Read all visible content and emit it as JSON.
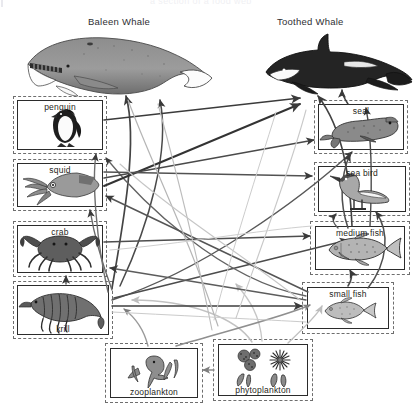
{
  "header": {
    "cropped_text": "a section of a food web",
    "visible": false
  },
  "diagram": {
    "producers": [
      "phytoplankton"
    ],
    "apex": [
      "Baleen Whale",
      "Toothed Whale"
    ]
  },
  "whales": [
    {
      "id": "baleen-whale",
      "label": "Baleen Whale",
      "x": 88,
      "y": 16
    },
    {
      "id": "toothed-whale",
      "label": "Toothed Whale",
      "x": 277,
      "y": 16
    }
  ],
  "nodes": [
    {
      "id": "penguin",
      "label": "penguin",
      "caption": "top",
      "x": 17,
      "y": 100,
      "w": 86,
      "h": 50,
      "dashed": true
    },
    {
      "id": "squid",
      "label": "squid",
      "caption": "top",
      "x": 17,
      "y": 163,
      "w": 86,
      "h": 44,
      "dashed": true
    },
    {
      "id": "crab",
      "label": "crab",
      "caption": "top",
      "x": 17,
      "y": 225,
      "w": 86,
      "h": 48,
      "dashed": true
    },
    {
      "id": "krill",
      "label": "krill",
      "caption": "bottom",
      "x": 17,
      "y": 285,
      "w": 92,
      "h": 50,
      "dashed": true
    },
    {
      "id": "seal",
      "label": "seal",
      "caption": "top",
      "x": 318,
      "y": 104,
      "w": 86,
      "h": 46,
      "dashed": true
    },
    {
      "id": "sea-bird",
      "label": "sea bird",
      "caption": "top",
      "x": 318,
      "y": 166,
      "w": 88,
      "h": 46,
      "dashed": true
    },
    {
      "id": "medium-fish",
      "label": "medium fish",
      "caption": "top",
      "x": 315,
      "y": 226,
      "w": 90,
      "h": 44,
      "dashed": true
    },
    {
      "id": "small-fish",
      "label": "small fish",
      "caption": "top",
      "x": 307,
      "y": 287,
      "w": 82,
      "h": 42,
      "dashed": true
    },
    {
      "id": "zooplankton",
      "label": "zooplankton",
      "caption": "bottom",
      "x": 110,
      "y": 348,
      "w": 88,
      "h": 50,
      "dashed": true
    },
    {
      "id": "phytoplankton",
      "label": "phytoplankton",
      "caption": "bottom",
      "x": 218,
      "y": 344,
      "w": 90,
      "h": 52,
      "dashed": true
    }
  ],
  "links": [
    {
      "from": "phytoplankton",
      "to": "zooplankton"
    },
    {
      "from": "phytoplankton",
      "to": "krill"
    },
    {
      "from": "phytoplankton",
      "to": "small-fish"
    },
    {
      "from": "zooplankton",
      "to": "krill"
    },
    {
      "from": "zooplankton",
      "to": "small-fish"
    },
    {
      "from": "krill",
      "to": "baleen-whale"
    },
    {
      "from": "krill",
      "to": "crab"
    },
    {
      "from": "krill",
      "to": "squid"
    },
    {
      "from": "krill",
      "to": "penguin"
    },
    {
      "from": "krill",
      "to": "small-fish"
    },
    {
      "from": "krill",
      "to": "seal"
    },
    {
      "from": "small-fish",
      "to": "medium-fish"
    },
    {
      "from": "small-fish",
      "to": "sea-bird"
    },
    {
      "from": "small-fish",
      "to": "penguin"
    },
    {
      "from": "small-fish",
      "to": "squid"
    },
    {
      "from": "medium-fish",
      "to": "toothed-whale"
    },
    {
      "from": "medium-fish",
      "to": "seal"
    },
    {
      "from": "medium-fish",
      "to": "sea-bird"
    },
    {
      "from": "squid",
      "to": "toothed-whale"
    },
    {
      "from": "squid",
      "to": "seal"
    },
    {
      "from": "penguin",
      "to": "toothed-whale"
    },
    {
      "from": "seal",
      "to": "toothed-whale"
    },
    {
      "from": "crab",
      "to": "medium-fish"
    }
  ],
  "colors": {
    "ink": "#2b2b2b",
    "dash": "#6e6e6e",
    "arrow_dark": "#3a3a3a",
    "arrow_light": "#b8b8b8",
    "paper": "#ffffff"
  }
}
